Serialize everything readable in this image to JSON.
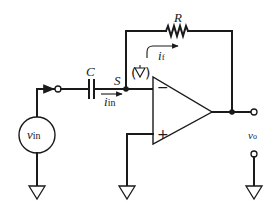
{
  "diagram": {
    "components": {
      "source": {
        "label": "v",
        "label_sub": "in"
      },
      "capacitor": {
        "label": "C"
      },
      "resistor": {
        "label": "R"
      },
      "summing_node": {
        "label": "S"
      },
      "input_current": {
        "label": "i",
        "label_sub": "in"
      },
      "feedback_current": {
        "label": "i",
        "label_sub": "f"
      },
      "output": {
        "label": "v",
        "label_sub": "o"
      },
      "opamp": {
        "inverting": "−",
        "noninverting": "+"
      }
    },
    "colors": {
      "stroke": "#1a1a1a",
      "background": "#ffffff"
    }
  }
}
